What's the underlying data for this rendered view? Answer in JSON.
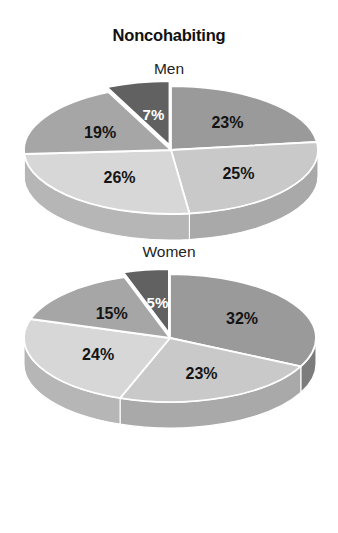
{
  "figure": {
    "title": "Noncohabiting",
    "background_color": "#ffffff"
  },
  "panels": [
    {
      "id": "men",
      "label": "Men"
    },
    {
      "id": "women",
      "label": "Women"
    }
  ],
  "labels": {
    "men": {
      "s1": "23%",
      "s2": "25%",
      "s3": "26%",
      "s4": "19%",
      "s5": "7%"
    },
    "women": {
      "s1": "32%",
      "s2": "23%",
      "s3": "24%",
      "s4": "15%",
      "s5": "5%"
    }
  },
  "palette": {
    "slice_1": "#9a9a9a",
    "slice_2": "#c9c9c9",
    "slice_3": "#d7d7d7",
    "slice_4": "#a6a6a6",
    "slice_5": "#616161",
    "side_1": "#7c7c7c",
    "side_2": "#a9a9a9",
    "side_3": "#b6b6b6",
    "side_4": "#8a8a8a",
    "side_5": "#4d4d4d",
    "separator": "#ffffff",
    "label_dark": "#141414",
    "label_light": "#ffffff"
  },
  "chart_data": [
    {
      "type": "pie",
      "title": "Noncohabiting",
      "subtitle": "Men",
      "categories": [
        "Segment 1",
        "Segment 2",
        "Segment 3",
        "Segment 4",
        "Segment 5"
      ],
      "values": [
        23,
        25,
        26,
        19,
        7
      ],
      "value_labels": [
        "23%",
        "25%",
        "26%",
        "19%",
        "7%"
      ],
      "units": "percent",
      "total": 100,
      "start_angle_deg": 0,
      "direction": "clockwise",
      "exploded_slices": [
        "Segment 5"
      ],
      "three_d": true,
      "legend": "none",
      "grid": false,
      "slice_colors": [
        "#9a9a9a",
        "#c9c9c9",
        "#d7d7d7",
        "#a6a6a6",
        "#616161"
      ]
    },
    {
      "type": "pie",
      "title": "Noncohabiting",
      "subtitle": "Women",
      "categories": [
        "Segment 1",
        "Segment 2",
        "Segment 3",
        "Segment 4",
        "Segment 5"
      ],
      "values": [
        32,
        23,
        24,
        15,
        5
      ],
      "value_labels": [
        "32%",
        "23%",
        "24%",
        "15%",
        "5%"
      ],
      "units": "percent",
      "total": 99,
      "start_angle_deg": 0,
      "direction": "clockwise",
      "exploded_slices": [
        "Segment 5"
      ],
      "three_d": true,
      "legend": "none",
      "grid": false,
      "slice_colors": [
        "#9a9a9a",
        "#c9c9c9",
        "#d7d7d7",
        "#a6a6a6",
        "#616161"
      ]
    }
  ]
}
